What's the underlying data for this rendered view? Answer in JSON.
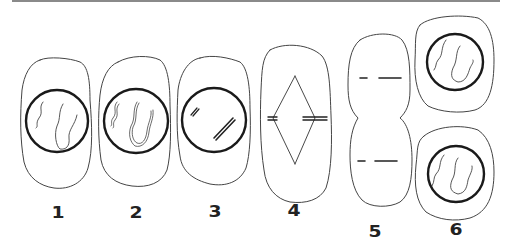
{
  "diagram": {
    "type": "cell-division-stages",
    "stages": [
      {
        "label": "1",
        "description": "cell with nucleus and thin chromatin threads"
      },
      {
        "label": "2",
        "description": "cell with nucleus and doubled chromatin threads"
      },
      {
        "label": "3",
        "description": "cell with nucleus and condensed paired chromosomes"
      },
      {
        "label": "4",
        "description": "cell with spindle and chromosomes at equator"
      },
      {
        "label": "5",
        "description": "cell pinching into two with chromosomes in each half"
      },
      {
        "label": "6",
        "description": "two daughter cells each with nucleus and chromatin"
      }
    ],
    "colors": {
      "line": "#333333",
      "nucleus": "#1a1a1a",
      "topline": "#8a8a8a",
      "background": "#ffffff"
    }
  }
}
